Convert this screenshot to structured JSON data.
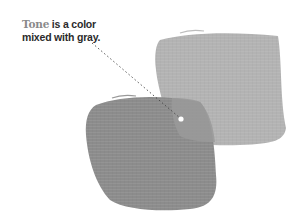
{
  "caption": {
    "term": "Tone",
    "definition": " is a color mixed with gray."
  },
  "colors": {
    "term": "#8a8a8a",
    "text": "#2b2b2b",
    "light_swatch": "#b3b3b3",
    "dark_swatch": "#8c8c8c",
    "overlap": "#9a9a9a",
    "pointer_dot": "#ffffff"
  },
  "swatches": [
    {
      "name": "light-gray-swatch",
      "label": "light tone"
    },
    {
      "name": "dark-gray-swatch",
      "label": "dark tone"
    }
  ]
}
